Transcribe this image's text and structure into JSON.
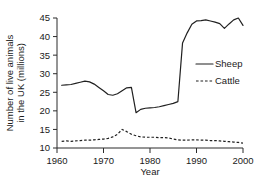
{
  "chart_data": {
    "type": "line",
    "title": "",
    "subtitle": "",
    "xlabel": "Year",
    "ylabel": "Number of live animals in the UK (millions)",
    "ylabel_line1": "Number of live animals",
    "ylabel_line2": "in the UK (millions)",
    "xlim": [
      1960,
      2000
    ],
    "ylim": [
      10,
      45
    ],
    "xticks": [
      1960,
      1970,
      1980,
      1990,
      2000
    ],
    "xtick_labels": [
      "1960",
      "1970",
      "1980",
      "1990",
      "2000"
    ],
    "yticks": [
      10,
      15,
      20,
      25,
      30,
      35,
      40,
      45
    ],
    "ytick_labels": [
      "10",
      "15",
      "20",
      "25",
      "30",
      "35",
      "40",
      "45"
    ],
    "grid": false,
    "legend_position": "right-middle",
    "legend_entries": [
      {
        "label": "Sheep",
        "style": "solid"
      },
      {
        "label": "Cattle",
        "style": "dashed"
      }
    ],
    "x": [
      1961,
      1962,
      1963,
      1964,
      1965,
      1966,
      1967,
      1968,
      1969,
      1970,
      1971,
      1972,
      1973,
      1974,
      1975,
      1976,
      1977,
      1978,
      1979,
      1980,
      1981,
      1982,
      1983,
      1984,
      1985,
      1986,
      1987,
      1988,
      1989,
      1990,
      1991,
      1992,
      1993,
      1994,
      1995,
      1996,
      1997,
      1998,
      1999,
      2000
    ],
    "series": [
      {
        "name": "Sheep",
        "style": "solid",
        "values": [
          26.9,
          27.0,
          27.1,
          27.4,
          27.7,
          28.0,
          27.8,
          27.2,
          26.3,
          25.4,
          24.4,
          24.2,
          24.6,
          25.4,
          26.2,
          26.3,
          19.5,
          20.4,
          20.7,
          20.8,
          20.9,
          21.1,
          21.4,
          21.7,
          22.0,
          22.5,
          38.3,
          41.0,
          43.3,
          44.2,
          44.3,
          44.5,
          44.2,
          43.9,
          43.5,
          42.2,
          43.4,
          44.5,
          45.0,
          43.0
        ]
      },
      {
        "name": "Cattle",
        "style": "dashed",
        "values": [
          11.8,
          11.9,
          11.8,
          11.9,
          12.0,
          12.1,
          12.1,
          12.2,
          12.3,
          12.4,
          12.6,
          13.0,
          13.7,
          15.0,
          14.4,
          13.7,
          13.3,
          13.0,
          12.9,
          12.9,
          12.9,
          12.8,
          12.8,
          12.7,
          12.4,
          12.2,
          12.1,
          12.1,
          12.2,
          12.2,
          12.1,
          12.1,
          12.0,
          12.0,
          11.9,
          11.8,
          11.7,
          11.6,
          11.5,
          11.3
        ]
      }
    ],
    "colors": {
      "line": "#202020",
      "axis": "#2b2b2b",
      "background": "#ffffff"
    }
  }
}
